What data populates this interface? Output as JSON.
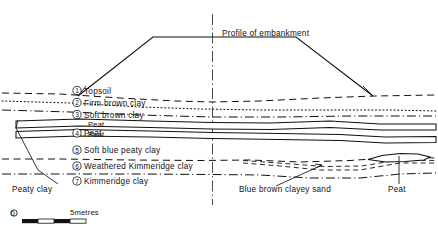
{
  "figure": {
    "title_annotation": "Profile of embankment",
    "width": 438,
    "height": 230,
    "background_color": "#ffffff",
    "ink_color": "#111111"
  },
  "strata_legend": [
    {
      "number": "1",
      "label": "Topsoil"
    },
    {
      "number": "2",
      "label": "Firm brown clay"
    },
    {
      "number": "3",
      "label": "Soft brown clay"
    },
    {
      "number": "4",
      "label": "Peat"
    },
    {
      "number": "5",
      "label": "Soft blue peaty clay"
    },
    {
      "number": "6",
      "label": "Weathered Kimmeridge clay"
    },
    {
      "number": "7",
      "label": "Kimmeridge clay"
    }
  ],
  "band_labels": [
    {
      "label": "Peat"
    },
    {
      "label": "Peat"
    }
  ],
  "callouts": [
    {
      "label": "Peaty clay"
    },
    {
      "label": "Blue brown clayey sand"
    },
    {
      "label": "Peat"
    }
  ],
  "scale_bar": {
    "start_label": "0",
    "end_label": "5metres",
    "segments": 4,
    "total_units": 5
  }
}
